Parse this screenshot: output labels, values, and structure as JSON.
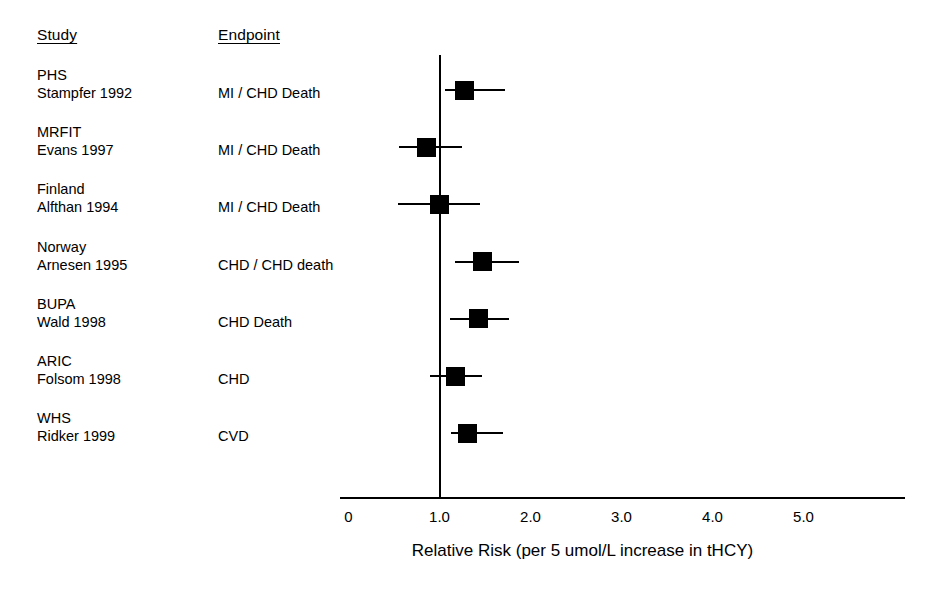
{
  "headers": {
    "study": "Study",
    "endpoint": "Endpoint"
  },
  "axis": {
    "title": "Relative Risk (per 5 umol/L increase in tHCY)",
    "tick_labels": [
      "0",
      "1.0",
      "2.0",
      "3.0",
      "4.0",
      "5.0"
    ],
    "null_value": "1.0"
  },
  "rows": [
    {
      "study": "PHS",
      "author": "Stampfer 1992",
      "endpoint": "MI / CHD Death",
      "rr": 1.28,
      "ci_low": 1.06,
      "ci_high": 1.72
    },
    {
      "study": "MRFIT",
      "author": "Evans 1997",
      "endpoint": "MI / CHD Death",
      "rr": 0.86,
      "ci_low": 0.56,
      "ci_high": 1.25
    },
    {
      "study": "Finland",
      "author": "Alfthan 1994",
      "endpoint": "MI / CHD Death",
      "rr": 1.0,
      "ci_low": 0.54,
      "ci_high": 1.45
    },
    {
      "study": "Norway",
      "author": "Arnesen 1995",
      "endpoint": "CHD / CHD death",
      "rr": 1.47,
      "ci_low": 1.17,
      "ci_high": 1.87
    },
    {
      "study": "BUPA",
      "author": "Wald 1998",
      "endpoint": "CHD Death",
      "rr": 1.43,
      "ci_low": 1.12,
      "ci_high": 1.76
    },
    {
      "study": "ARIC",
      "author": "Folsom 1998",
      "endpoint": "CHD",
      "rr": 1.18,
      "ci_low": 0.9,
      "ci_high": 1.47
    },
    {
      "study": "WHS",
      "author": "Ridker 1999",
      "endpoint": "CVD",
      "rr": 1.31,
      "ci_low": 1.13,
      "ci_high": 1.7
    }
  ],
  "chart_data": {
    "type": "forest",
    "title": "",
    "xlabel": "Relative Risk (per 5 umol/L increase in tHCY)",
    "ylabel": "",
    "xlim": [
      0,
      5.6
    ],
    "xticks": [
      0,
      1.0,
      2.0,
      3.0,
      4.0,
      5.0
    ],
    "xtick_labels": [
      "0",
      "1.0",
      "2.0",
      "3.0",
      "4.0",
      "5.0"
    ],
    "reference_line": 1.0,
    "grid": false,
    "legend": "none",
    "marker": "filled-square",
    "categories": [
      "PHS Stampfer 1992",
      "MRFIT Evans 1997",
      "Finland Alfthan 1994",
      "Norway Arnesen 1995",
      "BUPA Wald 1998",
      "ARIC Folsom 1998",
      "WHS Ridker 1999"
    ],
    "values": [
      1.28,
      0.86,
      1.0,
      1.47,
      1.43,
      1.18,
      1.31
    ],
    "ci_low": [
      1.06,
      0.56,
      0.54,
      1.17,
      1.12,
      0.9,
      1.13
    ],
    "ci_high": [
      1.72,
      1.25,
      1.45,
      1.87,
      1.76,
      1.47,
      1.7
    ],
    "endpoints": [
      "MI / CHD Death",
      "MI / CHD Death",
      "MI / CHD Death",
      "CHD / CHD death",
      "CHD Death",
      "CHD",
      "CVD"
    ]
  },
  "colors": {
    "ink": "#000000",
    "background": "#ffffff"
  }
}
